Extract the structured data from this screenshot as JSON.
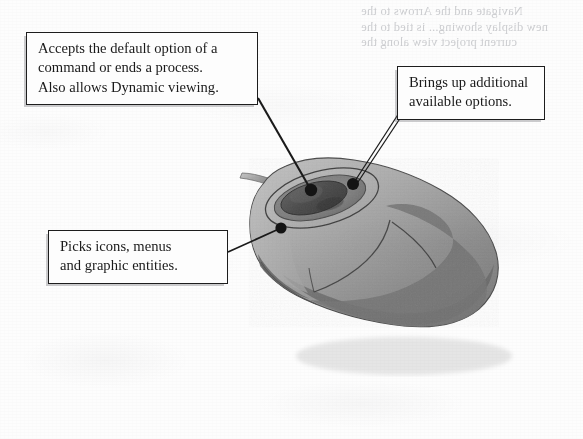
{
  "figure": {
    "name": "mouse-button-functions",
    "ghost_text_note": "faint mirrored bleed-through text from reverse side of page, illegible"
  },
  "callouts": [
    {
      "id": "accept",
      "name": "callout-accept-default-option",
      "lines": [
        "Accepts the default option of a",
        "command or ends a process.",
        "Also allows Dynamic viewing."
      ],
      "anchor_label": "scroll-wheel"
    },
    {
      "id": "options",
      "name": "callout-additional-options",
      "lines": [
        "Brings up additional",
        "available options."
      ],
      "anchor_label": "right-button"
    },
    {
      "id": "picks",
      "name": "callout-picks-icons-menus",
      "lines": [
        "Picks icons, menus",
        "and graphic entities."
      ],
      "anchor_label": "left-button"
    }
  ],
  "ghost": {
    "line1": "Navigate and the Arrows to the",
    "line2": "new display showing... is tied to the",
    "line3": "current project view along the"
  },
  "colors": {
    "page_background": "#fdfdfd",
    "ink": "#1d1d1d",
    "box_fill": "#fdfdfd",
    "box_shadow": "#5a5a5f",
    "mouse_body_light": "#b4b4b4",
    "mouse_body_mid": "#9a9a9a",
    "mouse_body_shadow": "#6e6e6e",
    "mouse_body_dark": "#5f5f5f",
    "wheel_dark": "#4b4b4b",
    "outline": "#3a3a3a",
    "anchor_dot": "#141414"
  }
}
